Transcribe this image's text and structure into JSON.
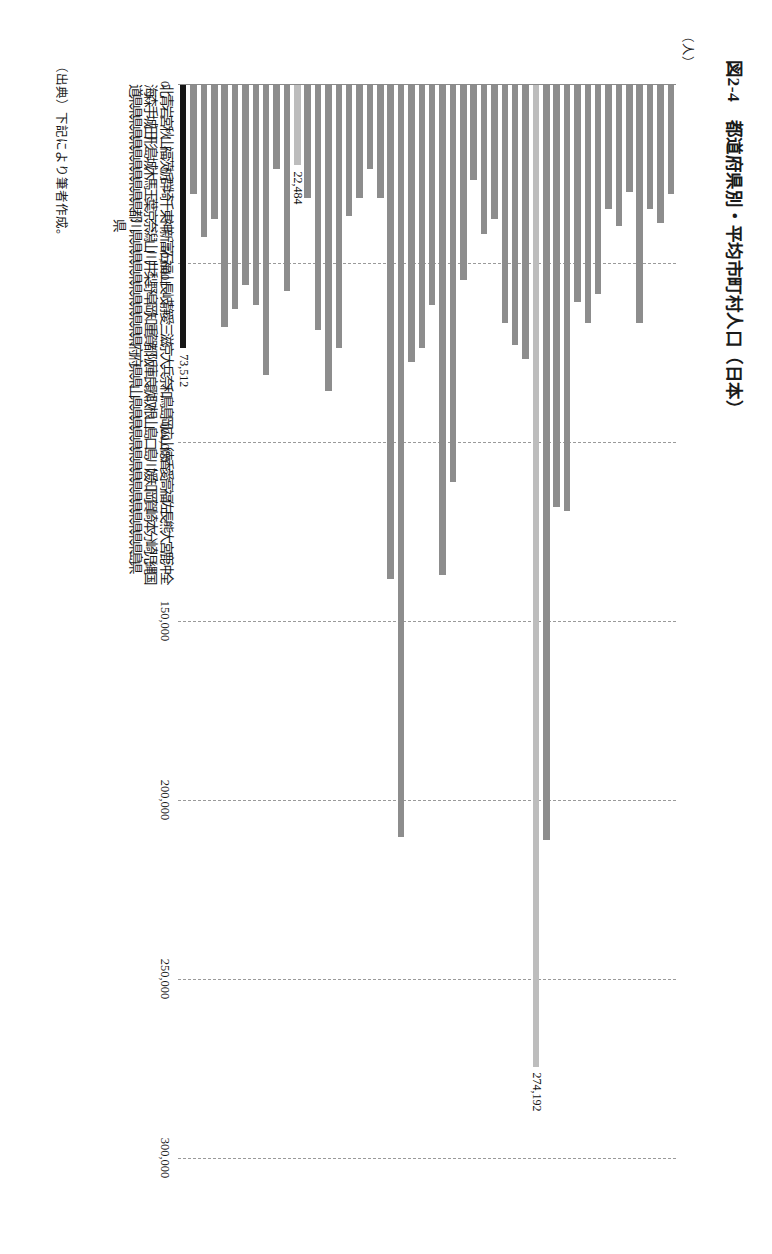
{
  "figure": {
    "title": "図2-4　都道府県別・平均市町村人口（日本）",
    "unit_label": "（人）",
    "source_note": "（出典）下記により筆者作成。"
  },
  "chart_data": {
    "type": "bar",
    "orientation": "vertical",
    "title": "図2-4　都道府県別・平均市町村人口（日本）",
    "xlabel": "",
    "ylabel": "（人）",
    "ylim": [
      0,
      300000
    ],
    "yticks": [
      0,
      50000,
      100000,
      150000,
      200000,
      250000,
      300000
    ],
    "ytick_labels": [
      "0",
      "50,000",
      "100,000",
      "150,000",
      "200,000",
      "250,000",
      "300,000"
    ],
    "grid": true,
    "legend": "none",
    "colors": {
      "bar": "#8d8d8d",
      "highlight_light": "#bdbdbd",
      "highlight_dark": "#161616",
      "gridline": "#9a9a9a",
      "axis": "#8a8a8a"
    },
    "annotations": [
      {
        "category": "神奈川県",
        "text": "274,192"
      },
      {
        "category": "香川県",
        "text": "22,484"
      },
      {
        "category": "全国",
        "text": "73,512"
      }
    ],
    "categories": [
      "北海道",
      "青森県",
      "岩手県",
      "宮城県",
      "秋田県",
      "山形県",
      "福島県",
      "茨城県",
      "栃木県",
      "群馬県",
      "埼玉県",
      "千葉県",
      "東京都",
      "神奈川県",
      "新潟県",
      "富山県",
      "石川県",
      "福井県",
      "山梨県",
      "長野県",
      "岐阜県",
      "静岡県",
      "愛知県",
      "三重県",
      "滋賀県",
      "京都府",
      "大阪府",
      "兵庫県",
      "奈良県",
      "和歌山県",
      "鳥取県",
      "島根県",
      "岡山県",
      "広島県",
      "山口県",
      "徳島県",
      "香川県",
      "愛媛県",
      "高知県",
      "福岡県",
      "佐賀県",
      "長崎県",
      "熊本県",
      "大分県",
      "宮崎県",
      "鹿児島県",
      "沖縄県",
      "全国"
    ],
    "category_rows": [
      {
        "name": "北",
        "suffix": "海道"
      },
      {
        "name": "青",
        "suffix": "森県"
      },
      {
        "name": "岩",
        "suffix": "手県"
      },
      {
        "name": "宮",
        "suffix": "城県"
      },
      {
        "name": "秋",
        "suffix": "田県"
      },
      {
        "name": "山",
        "suffix": "形県"
      },
      {
        "name": "福",
        "suffix": "島県"
      },
      {
        "name": "茨",
        "suffix": "城県"
      },
      {
        "name": "栃",
        "suffix": "木県"
      },
      {
        "name": "群",
        "suffix": "馬県"
      },
      {
        "name": "埼",
        "suffix": "玉県"
      },
      {
        "name": "千",
        "suffix": "葉県"
      },
      {
        "name": "東",
        "suffix": "京都"
      },
      {
        "name": "神奈",
        "suffix": "川県"
      },
      {
        "name": "新",
        "suffix": "潟県"
      },
      {
        "name": "富",
        "suffix": "山県"
      },
      {
        "name": "石",
        "suffix": "川県"
      },
      {
        "name": "福",
        "suffix": "井県"
      },
      {
        "name": "山",
        "suffix": "梨県"
      },
      {
        "name": "長",
        "suffix": "野県"
      },
      {
        "name": "岐",
        "suffix": "阜県"
      },
      {
        "name": "静",
        "suffix": "岡県"
      },
      {
        "name": "愛",
        "suffix": "知県"
      },
      {
        "name": "三",
        "suffix": "重県"
      },
      {
        "name": "滋",
        "suffix": "賀県"
      },
      {
        "name": "京",
        "suffix": "都府"
      },
      {
        "name": "大",
        "suffix": "阪府"
      },
      {
        "name": "兵",
        "suffix": "庫県"
      },
      {
        "name": "奈",
        "suffix": "良県"
      },
      {
        "name": "和",
        "suffix": "歌山"
      },
      {
        "name": "鳥",
        "suffix": "取県"
      },
      {
        "name": "島",
        "suffix": "根県"
      },
      {
        "name": "岡",
        "suffix": "山県"
      },
      {
        "name": "広",
        "suffix": "島県"
      },
      {
        "name": "山",
        "suffix": "口県"
      },
      {
        "name": "徳",
        "suffix": "島県"
      },
      {
        "name": "香",
        "suffix": "川県"
      },
      {
        "name": "愛",
        "suffix": "媛県"
      },
      {
        "name": "高",
        "suffix": "知県"
      },
      {
        "name": "福",
        "suffix": "岡県"
      },
      {
        "name": "佐",
        "suffix": "賀県"
      },
      {
        "name": "長",
        "suffix": "崎県"
      },
      {
        "name": "熊",
        "suffix": "本県"
      },
      {
        "name": "大",
        "suffix": "分県"
      },
      {
        "name": "宮",
        "suffix": "崎県"
      },
      {
        "name": "鹿",
        "suffix": "児島"
      },
      {
        "name": "沖",
        "suffix": "縄県"
      },
      {
        "name": "全",
        "suffix": "国"
      }
    ],
    "values": [
      30500,
      38500,
      34500,
      66500,
      30000,
      39500,
      34500,
      58500,
      66500,
      60500,
      119000,
      118000,
      211000,
      274192,
      76500,
      72500,
      66500,
      37500,
      41500,
      26500,
      54500,
      111000,
      137000,
      61500,
      73500,
      77500,
      210000,
      138000,
      31500,
      23500,
      31500,
      36500,
      73500,
      85500,
      68500,
      31500,
      22484,
      57500,
      23500,
      81000,
      61500,
      56000,
      62500,
      67500,
      37500,
      42500,
      30500,
      73512
    ],
    "bar_styles": [
      "normal",
      "normal",
      "normal",
      "normal",
      "normal",
      "normal",
      "normal",
      "normal",
      "normal",
      "normal",
      "normal",
      "normal",
      "normal",
      "hl-light",
      "normal",
      "normal",
      "normal",
      "normal",
      "normal",
      "normal",
      "normal",
      "normal",
      "normal",
      "normal",
      "normal",
      "normal",
      "normal",
      "normal",
      "normal",
      "normal",
      "normal",
      "normal",
      "normal",
      "normal",
      "normal",
      "normal",
      "hl-light",
      "normal",
      "normal",
      "normal",
      "normal",
      "normal",
      "normal",
      "normal",
      "normal",
      "normal",
      "normal",
      "hl-dark"
    ]
  }
}
